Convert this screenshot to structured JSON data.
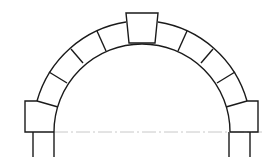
{
  "diagram": {
    "type": "stone arch line drawing",
    "colors": {
      "stroke": "#1a1a1a",
      "centerline": "#c8c8c8",
      "background": "#ffffff"
    },
    "arch": {
      "center": [
        142,
        132
      ],
      "outer_radius": 110,
      "inner_radius": 88
    },
    "keystone": {
      "top": [
        [
          126,
          13
        ],
        [
          158,
          13
        ]
      ],
      "bottom": [
        [
          129,
          43
        ],
        [
          155,
          43
        ]
      ]
    },
    "voussoir_joints_left": [
      [
        [
          37,
          101
        ],
        [
          58,
          107
        ]
      ],
      [
        [
          49,
          72
        ],
        [
          67,
          83
        ]
      ],
      [
        [
          71,
          49
        ],
        [
          83,
          63
        ]
      ],
      [
        [
          97,
          31
        ],
        [
          106,
          51
        ]
      ]
    ],
    "voussoir_joints_right": [
      [
        [
          247,
          101
        ],
        [
          226,
          107
        ]
      ],
      [
        [
          235,
          72
        ],
        [
          217,
          83
        ]
      ],
      [
        [
          213,
          49
        ],
        [
          201,
          63
        ]
      ],
      [
        [
          187,
          31
        ],
        [
          178,
          51
        ]
      ]
    ],
    "springer_left": {
      "x": 25,
      "top": 101,
      "bottom": 132
    },
    "springer_right": {
      "x": 258,
      "top": 100,
      "bottom": 132
    },
    "piers": {
      "left": [
        33,
        54
      ],
      "right": [
        229,
        250
      ],
      "bottom": 157
    },
    "centerline_y": 132
  }
}
